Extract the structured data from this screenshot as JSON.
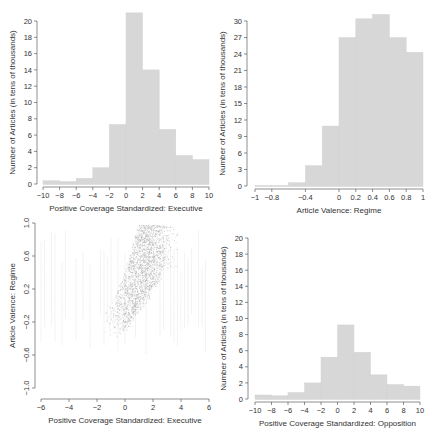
{
  "chart_data": [
    {
      "id": "hist_exec",
      "type": "bar",
      "panel": "top-left",
      "title": "",
      "xlabel": "Positive Coverage Standardized: Executive",
      "ylabel": "Number of Articles (in tens of thousands)",
      "bin_edges": [
        -10,
        -8,
        -6,
        -4,
        -2,
        0,
        2,
        4,
        6,
        8,
        10
      ],
      "values": [
        0.4,
        0.3,
        0.7,
        2.0,
        7.3,
        21.0,
        14.0,
        6.7,
        3.5,
        3.0
      ],
      "xticks": [
        -10,
        -8,
        -6,
        -4,
        -2,
        0,
        2,
        4,
        6,
        8,
        10
      ],
      "yticks": [
        0,
        2,
        4,
        6,
        8,
        10,
        12,
        14,
        16,
        18,
        20
      ],
      "xlim": [
        -10,
        10
      ],
      "ylim": [
        0,
        20
      ],
      "grid": false,
      "frame": {
        "x0": 43,
        "x1": 209,
        "y0": 184,
        "yTop": 21,
        "axisX": 37
      }
    },
    {
      "id": "hist_regime",
      "type": "bar",
      "panel": "top-right",
      "title": "",
      "xlabel": "Article Valence: Regime",
      "ylabel": "Number of Articles (in tens of thousands)",
      "bin_edges": [
        -1,
        -0.8,
        -0.6,
        -0.4,
        -0.2,
        0,
        0.2,
        0.4,
        0.6,
        0.8,
        1
      ],
      "values": [
        0.1,
        0.1,
        0.6,
        3.7,
        10.9,
        27.0,
        30.4,
        31.2,
        27.0,
        24.3
      ],
      "xticks": [
        -1,
        -0.8,
        -0.4,
        0,
        0.2,
        0.4,
        0.6,
        0.8,
        1
      ],
      "xtick_labels": [
        "−1",
        "−0.8",
        "−0.4",
        "0",
        "0.2",
        "0.4",
        "0.6",
        "0.8",
        "1"
      ],
      "yticks": [
        0,
        3,
        6,
        9,
        12,
        15,
        18,
        21,
        24,
        27,
        30
      ],
      "xlim": [
        -1,
        1
      ],
      "ylim": [
        0,
        30
      ],
      "grid": false,
      "frame": {
        "x0": 255,
        "x1": 423,
        "y0": 186,
        "yTop": 21,
        "axisX": 247
      }
    },
    {
      "id": "scatter",
      "type": "scatter",
      "panel": "bottom-left",
      "title": "",
      "xlabel": "Positive Coverage Standardized: Executive",
      "ylabel": "Article Valence: Regime",
      "xticks": [
        -6,
        -4,
        -2,
        0,
        2,
        4,
        6
      ],
      "yticks": [
        -1.0,
        -0.6,
        -0.2,
        0.2,
        0.6,
        1.0
      ],
      "ytick_labels": [
        "−1.0",
        "−0.6",
        "−0.2",
        "0.2",
        "0.6",
        "1.0"
      ],
      "xlim": [
        -6,
        6
      ],
      "ylim": [
        -1,
        1
      ],
      "description": "Dense cloud of points concentrated between x≈-1 and x≈3, rising from y≈-0.3 to y≈1.0; sparse vertical streaks across x from -6 to 6",
      "cloud_trend": [
        {
          "x": -1.0,
          "y_low": -0.35,
          "y_high": 0.0
        },
        {
          "x": 0.0,
          "y_low": -0.3,
          "y_high": 0.4
        },
        {
          "x": 1.0,
          "y_low": -0.05,
          "y_high": 1.0
        },
        {
          "x": 2.0,
          "y_low": 0.2,
          "y_high": 1.0
        },
        {
          "x": 3.0,
          "y_low": 0.5,
          "y_high": 1.0
        }
      ],
      "grid": false,
      "frame": {
        "x0": 41,
        "x1": 209,
        "y0": 399,
        "yTopVal": 223,
        "yBotVal": 388,
        "axisX": 35
      }
    },
    {
      "id": "hist_opp",
      "type": "bar",
      "panel": "bottom-right",
      "title": "",
      "xlabel": "Positive Coverage Standardized: Opposition",
      "ylabel": "Number of Articles (in tens of thousands)",
      "bin_edges": [
        -10,
        -8,
        -6,
        -4,
        -2,
        0,
        2,
        4,
        6,
        8,
        10
      ],
      "values": [
        0.5,
        0.4,
        0.8,
        2.0,
        5.2,
        9.2,
        5.8,
        3.0,
        1.8,
        1.6
      ],
      "xticks": [
        -10,
        -8,
        -6,
        -4,
        -2,
        0,
        2,
        4,
        6,
        8,
        10
      ],
      "yticks": [
        0,
        2,
        4,
        6,
        8,
        10,
        12,
        14,
        16,
        18,
        20
      ],
      "xlim": [
        -10,
        10
      ],
      "ylim": [
        0,
        20
      ],
      "grid": false,
      "frame": {
        "x0": 255,
        "x1": 420,
        "y0": 399,
        "yTop": 238,
        "axisX": 248
      }
    }
  ],
  "style": {
    "bar_fill": "#d7d7d7",
    "bar_stroke": "#cfcfcf",
    "axis": "#444444",
    "point": "#9a9a9a"
  }
}
